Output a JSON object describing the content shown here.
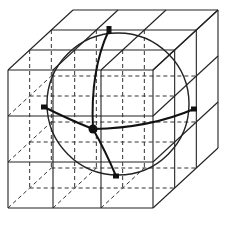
{
  "diagram": {
    "type": "3x3x3 cube grid enclosing a sphere with great-circle arcs",
    "line_color": "#222222",
    "front_face": {
      "x": [
        8,
        53,
        101,
        153
      ],
      "y": [
        70,
        116,
        162,
        208
      ]
    },
    "offset": {
      "dx": 65,
      "dy": -60
    },
    "sphere": {
      "cx": 118,
      "cy": 104,
      "r": 71
    },
    "markers": [
      {
        "name": "top",
        "x": 109,
        "y": 30
      },
      {
        "name": "left",
        "x": 44,
        "y": 107
      },
      {
        "name": "right",
        "x": 194,
        "y": 109
      },
      {
        "name": "bottom",
        "x": 116,
        "y": 176
      }
    ],
    "center_point": {
      "x": 93,
      "y": 129
    }
  },
  "caption": ""
}
